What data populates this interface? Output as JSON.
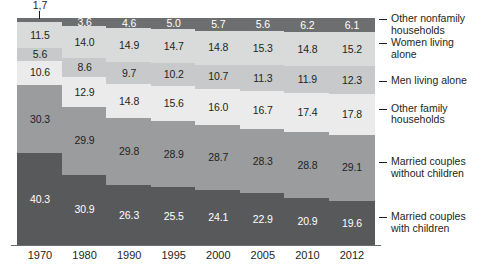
{
  "chart_data": {
    "type": "bar",
    "subtype": "stacked-bar-100",
    "title": "",
    "subtitle": "",
    "xlabel": "",
    "ylabel": "",
    "ylim": [
      0,
      100
    ],
    "grid": false,
    "legend_position": "right",
    "categories": [
      "1970",
      "1980",
      "1990",
      "1995",
      "2000",
      "2005",
      "2010",
      "2012"
    ],
    "series": [
      {
        "name": "Married couples with children",
        "color": "#58595b",
        "values": [
          40.3,
          30.9,
          26.3,
          25.5,
          24.1,
          22.9,
          20.9,
          19.6
        ]
      },
      {
        "name": "Married couples without children",
        "color": "#9b9c9e",
        "values": [
          30.3,
          29.9,
          29.8,
          28.9,
          28.7,
          28.3,
          28.8,
          29.1
        ]
      },
      {
        "name": "Other family households",
        "color": "#ebebeb",
        "values": [
          10.6,
          12.9,
          14.8,
          15.6,
          16.0,
          16.7,
          17.4,
          17.8
        ]
      },
      {
        "name": "Men living alone",
        "color": "#c8c9ca",
        "values": [
          5.6,
          8.6,
          9.7,
          10.2,
          10.7,
          11.3,
          11.9,
          12.3
        ]
      },
      {
        "name": "Women living alone",
        "color": "#d9dada",
        "values": [
          11.5,
          14.0,
          14.9,
          14.7,
          14.8,
          15.3,
          14.8,
          15.2
        ]
      },
      {
        "name": "Other nonfamily households",
        "color": "#6d6e70",
        "values": [
          1.7,
          3.6,
          4.6,
          5.0,
          5.7,
          5.6,
          6.2,
          6.1
        ]
      }
    ],
    "value_labels": {
      "1970": [
        "1,7",
        "11.5",
        "5.6",
        "10.6",
        "30.3",
        "40.3"
      ],
      "1980": [
        "3.6",
        "14.0",
        "8.6",
        "12.9",
        "29.9",
        "30.9"
      ],
      "1990": [
        "4.6",
        "14.9",
        "9.7",
        "14.8",
        "29.8",
        "26.3"
      ],
      "1995": [
        "5.0",
        "14.7",
        "10.2",
        "15.6",
        "28.9",
        "25.5"
      ],
      "2000": [
        "5.7",
        "14.8",
        "10.7",
        "16.0",
        "28.7",
        "24.1"
      ],
      "2005": [
        "5.6",
        "15.3",
        "11.3",
        "16.7",
        "28.3",
        "22.9"
      ],
      "2010": [
        "6.2",
        "14.8",
        "11.9",
        "17.4",
        "28.8",
        "20.9"
      ],
      "2012": [
        "6.1",
        "15.2",
        "12.3",
        "17.8",
        "29.1",
        "19.6"
      ]
    },
    "callout": {
      "category": "1970",
      "series": "Other nonfamily households",
      "label": "1,7"
    }
  },
  "legend": {
    "items": [
      {
        "label": "Other nonfamily\nhouseholds",
        "color": "#6d6e70"
      },
      {
        "label": "Women living\nalone",
        "color": "#d9dada"
      },
      {
        "label": "Men living alone",
        "color": "#c8c9ca"
      },
      {
        "label": "Other family\nhouseholds",
        "color": "#ebebeb"
      },
      {
        "label": "Married couples\nwithout children",
        "color": "#9b9c9e"
      },
      {
        "label": "Married couples\nwith children",
        "color": "#58595b"
      }
    ]
  },
  "axis": {
    "tick_labels": [
      "1970",
      "1980",
      "1990",
      "1995",
      "2000",
      "2005",
      "2010",
      "2012"
    ]
  }
}
